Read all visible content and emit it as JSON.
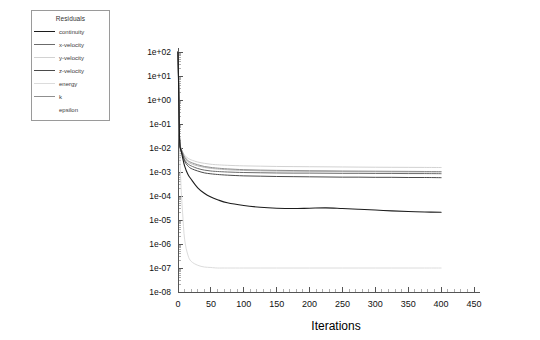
{
  "legend": {
    "title": "Residuals",
    "entries": [
      {
        "label": "continuity",
        "color": "#1c1c1c",
        "has_swatch": true
      },
      {
        "label": "x-velocity",
        "color": "#6b6b6b",
        "has_swatch": true
      },
      {
        "label": "y-velocity",
        "color": "#d2d2d2",
        "has_swatch": true
      },
      {
        "label": "z-velocity",
        "color": "#4a4a4a",
        "has_swatch": true
      },
      {
        "label": "energy",
        "color": "#dcdcdc",
        "has_swatch": true
      },
      {
        "label": "k",
        "color": "#8f8f8f",
        "has_swatch": true
      },
      {
        "label": "epsilon",
        "color": "#bdbdbd",
        "has_swatch": false
      }
    ]
  },
  "chart_data": {
    "type": "line",
    "title": "Residuals",
    "xlabel": "Iterations",
    "ylabel": "",
    "xlim": [
      0,
      450
    ],
    "ylim": [
      1e-08,
      100.0
    ],
    "yscale": "log",
    "grid": false,
    "legend_position": "outside-top-left",
    "x_ticks": [
      0,
      50,
      100,
      150,
      200,
      250,
      300,
      350,
      400,
      450
    ],
    "x_tick_labels": [
      "0",
      "50",
      "100",
      "150",
      "200",
      "250",
      "300",
      "350",
      "400",
      "450"
    ],
    "y_ticks": [
      100,
      10,
      1,
      0.1,
      0.01,
      0.001,
      0.0001,
      1e-05,
      1e-06,
      1e-07,
      1e-08
    ],
    "y_tick_labels": [
      "1e+02",
      "1e+01",
      "1e+00",
      "1e-01",
      "1e-02",
      "1e-03",
      "1e-04",
      "1e-05",
      "1e-06",
      "1e-07",
      "1e-08"
    ],
    "x": [
      0,
      1,
      2,
      3,
      4,
      5,
      7,
      10,
      15,
      20,
      30,
      40,
      50,
      60,
      75,
      100,
      125,
      150,
      175,
      200,
      225,
      250,
      275,
      300,
      325,
      350,
      375,
      400
    ],
    "series": [
      {
        "name": "continuity",
        "color": "#1c1c1c",
        "width": 1.1,
        "values": [
          100,
          3,
          0.05,
          0.012,
          0.009,
          0.007,
          0.004,
          0.0018,
          0.0008,
          0.0005,
          0.00022,
          0.00013,
          9e-05,
          7e-05,
          5.2e-05,
          4e-05,
          3.4e-05,
          3.1e-05,
          3e-05,
          3.1e-05,
          3.2e-05,
          3e-05,
          2.8e-05,
          2.6e-05,
          2.4e-05,
          2.25e-05,
          2.15e-05,
          2.1e-05
        ]
      },
      {
        "name": "x-velocity",
        "color": "#6b6b6b",
        "width": 1.0,
        "values": [
          100,
          4,
          0.06,
          0.013,
          0.0095,
          0.008,
          0.0055,
          0.0032,
          0.0022,
          0.0018,
          0.0014,
          0.0012,
          0.0011,
          0.00105,
          0.001,
          0.00095,
          0.00093,
          0.00091,
          0.0009,
          0.0009,
          0.00089,
          0.00088,
          0.00088,
          0.00087,
          0.00087,
          0.00086,
          0.00086,
          0.00085
        ]
      },
      {
        "name": "y-velocity",
        "color": "#d2d2d2",
        "width": 1.0,
        "values": [
          100,
          5,
          0.07,
          0.014,
          0.011,
          0.009,
          0.007,
          0.005,
          0.0038,
          0.0032,
          0.0026,
          0.0023,
          0.0021,
          0.002,
          0.0019,
          0.0018,
          0.00175,
          0.0017,
          0.00168,
          0.00166,
          0.00164,
          0.00162,
          0.0016,
          0.00158,
          0.00157,
          0.00156,
          0.00155,
          0.00154
        ]
      },
      {
        "name": "z-velocity",
        "color": "#4a4a4a",
        "width": 1.0,
        "values": [
          100,
          3.5,
          0.055,
          0.0125,
          0.0092,
          0.0075,
          0.005,
          0.0028,
          0.0018,
          0.0014,
          0.0011,
          0.00092,
          0.00084,
          0.00079,
          0.00074,
          0.00069,
          0.00067,
          0.00065,
          0.00064,
          0.00063,
          0.00062,
          0.00061,
          0.00061,
          0.0006,
          0.0006,
          0.00059,
          0.00059,
          0.00058
        ]
      },
      {
        "name": "energy",
        "color": "#dcdcdc",
        "width": 1.0,
        "values": [
          100,
          2,
          0.03,
          0.003,
          0.0006,
          0.00015,
          2e-05,
          1.6e-06,
          3.5e-07,
          1.9e-07,
          1.3e-07,
          1.1e-07,
          1.05e-07,
          1e-07,
          1e-07,
          1e-07,
          1e-07,
          1e-07,
          1e-07,
          1e-07,
          1e-07,
          1e-07,
          1e-07,
          1e-07,
          1e-07,
          1e-07,
          1e-07,
          1e-07
        ]
      },
      {
        "name": "k",
        "color": "#8f8f8f",
        "width": 1.0,
        "values": [
          100,
          4.5,
          0.065,
          0.0135,
          0.0105,
          0.0088,
          0.0065,
          0.0042,
          0.003,
          0.0025,
          0.002,
          0.0017,
          0.00155,
          0.00145,
          0.00135,
          0.00125,
          0.0012,
          0.00117,
          0.00115,
          0.00113,
          0.00112,
          0.0011,
          0.00109,
          0.00108,
          0.00107,
          0.00106,
          0.00105,
          0.00104
        ]
      },
      {
        "name": "epsilon",
        "color": "#bdbdbd",
        "width": 1.0,
        "values": [
          100,
          4.2,
          0.062,
          0.0132,
          0.0102,
          0.0085,
          0.0062,
          0.0039,
          0.0027,
          0.0022,
          0.0018,
          0.00155,
          0.00142,
          0.00133,
          0.00124,
          0.00116,
          0.00112,
          0.00109,
          0.00107,
          0.00106,
          0.00105,
          0.00104,
          0.00103,
          0.00102,
          0.00101,
          0.001,
          0.000998,
          0.00099
        ]
      }
    ]
  }
}
